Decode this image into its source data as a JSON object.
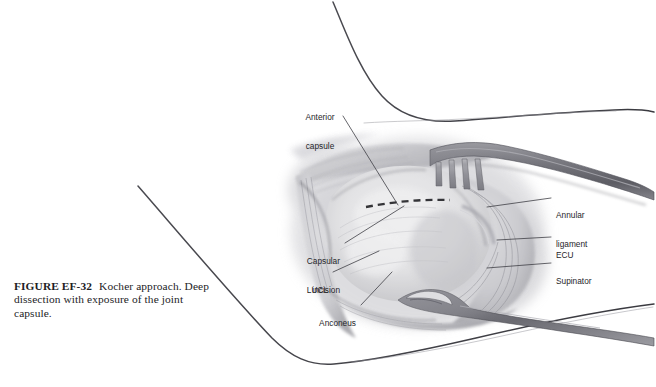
{
  "figure": {
    "number": "FIGURE EF-32",
    "caption": "Kocher approach. Deep dissection with exposure of the joint capsule.",
    "illustration_alt": "grayscale-surgical-illustration-elbow-kocher-approach",
    "background_color": "#ffffff",
    "ink_color": "#3a3a3f",
    "label_color": "#26262a"
  },
  "labels": [
    {
      "id": "anterior-capsule",
      "text_line1": "Anterior",
      "text_line2": "capsule"
    },
    {
      "id": "annular-ligament",
      "text_line1": "Annular",
      "text_line2": "ligament"
    },
    {
      "id": "ecu",
      "text_line1": "ECU",
      "text_line2": ""
    },
    {
      "id": "supinator",
      "text_line1": "Supinator",
      "text_line2": ""
    },
    {
      "id": "capsular-incision",
      "text_line1": "Capsular",
      "text_line2": "incision"
    },
    {
      "id": "lucl",
      "text_line1": "LUCL",
      "text_line2": ""
    },
    {
      "id": "anconeus",
      "text_line1": "Anconeus",
      "text_line2": ""
    }
  ]
}
